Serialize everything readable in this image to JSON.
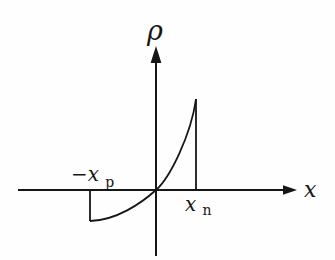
{
  "diagram": {
    "axis_labels": {
      "vertical": "ρ",
      "horizontal": "x"
    },
    "boundary_labels": {
      "left_main": "−x",
      "left_sub": "p",
      "right_main": "x",
      "right_sub": "n"
    },
    "colors": {
      "ink": "#161616",
      "background": "#fefefe"
    }
  }
}
